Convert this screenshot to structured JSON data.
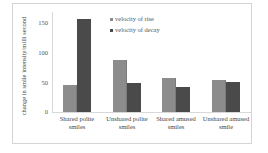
{
  "chart_data": {
    "type": "bar",
    "title": "",
    "xlabel": "",
    "ylabel": "change in smile intensity/milli second",
    "ylim": [
      0,
      160
    ],
    "yticks": [
      0,
      50,
      100,
      150
    ],
    "grid": false,
    "legend_position": "top-right-inside",
    "categories": [
      "Shared polite smiles",
      "Unshared polite smiles",
      "Shared amused smiles",
      "Unshared amused smile"
    ],
    "series": [
      {
        "name": "velocity of rise",
        "color": "#8c8c8c",
        "values": [
          45,
          87,
          58,
          54
        ]
      },
      {
        "name": "velocity of decay",
        "color": "#4a4a4a",
        "values": [
          155,
          49,
          43,
          51
        ]
      }
    ]
  },
  "labels": {
    "ylabel": "change in smile intensity/milli second",
    "ticks": [
      "0",
      "50",
      "100",
      "150"
    ],
    "cat0_line1": "Shared polite",
    "cat0_line2": "smiles",
    "cat1_line1": "Unshared polite",
    "cat1_line2": "smiles",
    "cat2_line1": "Shared amused",
    "cat2_line2": "smiles",
    "cat3_line1": "Unshared amused",
    "cat3_line2": "smile",
    "legend_rise": "velocity of rise",
    "legend_decay": "velocity of decay"
  }
}
